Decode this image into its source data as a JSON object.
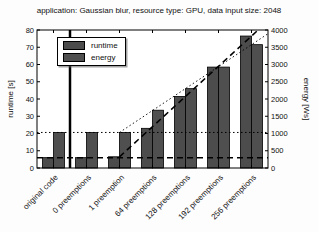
{
  "chart_data": {
    "type": "bar",
    "title": "application: Gaussian blur, resource type: GPU, data input size: 2048",
    "categories": [
      "original code",
      "0 preemptions",
      "1 preemption",
      "64 preemptions",
      "128 preemptions",
      "192 preemptions",
      "256 preemptions"
    ],
    "series": [
      {
        "name": "runtime",
        "axis": "left",
        "unit": "s",
        "color": "#4c4c4c",
        "values": [
          6,
          6,
          6.5,
          23,
          41.5,
          58.5,
          76.5
        ]
      },
      {
        "name": "energy",
        "axis": "right",
        "unit": "Ws",
        "color": "#4f4f4f",
        "values": [
          1030,
          1030,
          1030,
          1675,
          2300,
          2925,
          3575
        ]
      }
    ],
    "left_axis": {
      "label": "runtime [s]",
      "min": 0,
      "max": 80,
      "tick_step": 10
    },
    "right_axis": {
      "label": "energy [Ws]",
      "min": 0,
      "max": 4000,
      "tick_step": 500
    },
    "legend": {
      "position": "top-left",
      "entries": [
        "runtime",
        "energy"
      ]
    },
    "reference_lines": [
      {
        "type": "h-dashed",
        "axis": "left",
        "value": 6
      },
      {
        "type": "h-dotted",
        "axis": "left",
        "value": 20.6
      },
      {
        "type": "v-separator",
        "after_category_index": 0
      },
      {
        "type": "trend-dashed",
        "series": "runtime",
        "from_category_index": 2,
        "to_category_index": 6
      },
      {
        "type": "trend-dotted",
        "series": "energy",
        "from_category_index": 2,
        "to_category_index": 6
      }
    ],
    "bar_outline": "#000000",
    "grid": false
  }
}
